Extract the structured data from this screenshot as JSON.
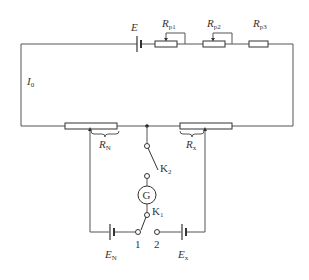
{
  "diagram": {
    "labels": {
      "E": "E",
      "Rp1": {
        "main": "R",
        "sub": "p1"
      },
      "Rp2": {
        "main": "R",
        "sub": "p2"
      },
      "Rp3": {
        "main": "R",
        "sub": "p3"
      },
      "I0": {
        "main": "I",
        "sub": "0"
      },
      "RN": {
        "main": "R",
        "sub": "N"
      },
      "Rx": {
        "main": "R",
        "sub": "x"
      },
      "K2": {
        "main": "K",
        "sub": "2"
      },
      "G": "G",
      "K1": {
        "main": "K",
        "sub": "1"
      },
      "terminal1": "1",
      "terminal2": "2",
      "EN": {
        "main": "E",
        "sub": "N"
      },
      "Ex": {
        "main": "E",
        "sub": "x"
      }
    },
    "components": [
      {
        "id": "E",
        "type": "battery",
        "role": "working source"
      },
      {
        "id": "Rp1",
        "type": "rheostat"
      },
      {
        "id": "Rp2",
        "type": "rheostat"
      },
      {
        "id": "Rp3",
        "type": "resistor"
      },
      {
        "id": "RN",
        "type": "slide-wire segment"
      },
      {
        "id": "Rx",
        "type": "slide-wire segment"
      },
      {
        "id": "K2",
        "type": "switch"
      },
      {
        "id": "G",
        "type": "galvanometer"
      },
      {
        "id": "K1",
        "type": "two-way switch",
        "positions": [
          "1",
          "2"
        ]
      },
      {
        "id": "EN",
        "type": "battery",
        "role": "standard cell"
      },
      {
        "id": "Ex",
        "type": "battery",
        "role": "unknown EMF"
      }
    ],
    "colors": {
      "wire": "#555555",
      "component": "#333333",
      "background": "#ffffff"
    }
  }
}
